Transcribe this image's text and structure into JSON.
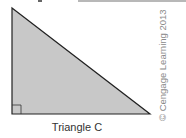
{
  "figure": {
    "label": "Triangle C",
    "copyright": "© Cengage Learning 2013",
    "fill_color": "#c8c8c8",
    "stroke_color": "#222222",
    "right_angle_marker": true
  }
}
